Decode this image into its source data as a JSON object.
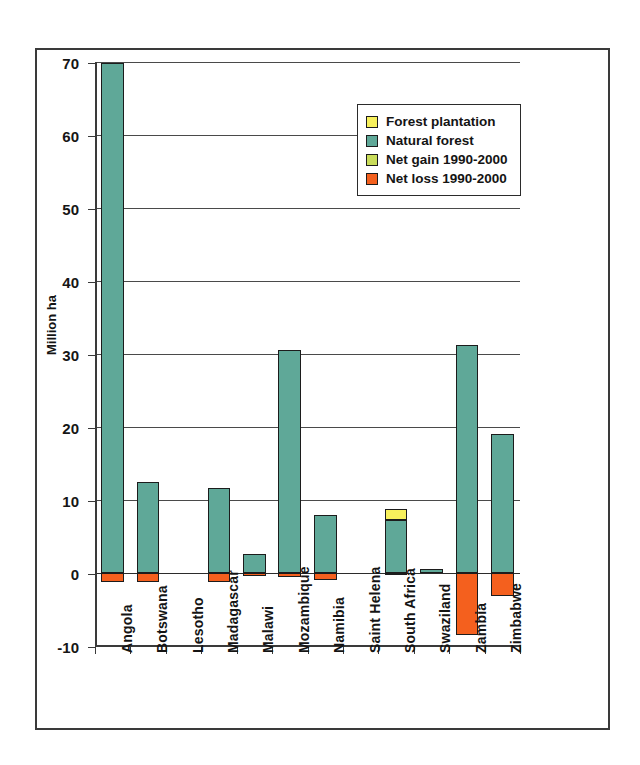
{
  "chart_data": {
    "type": "bar",
    "title": "",
    "subtitle": "",
    "xlabel": "",
    "ylabel": "Million ha",
    "ylim": [
      -10,
      70
    ],
    "ytick_values": [
      70,
      60,
      50,
      40,
      30,
      20,
      10,
      0,
      -10
    ],
    "ytick_labels": [
      "70",
      "60",
      "50",
      "40",
      "30",
      "20",
      "10",
      "0",
      "-10"
    ],
    "grid": "horizontal",
    "stacked": true,
    "legend_position": "upper-center-right",
    "categories": [
      "Angola",
      "Botswana",
      "Lesotho",
      "Madagascar",
      "Malawi",
      "Mozambique",
      "Namibia",
      "Saint Helena",
      "South Africa",
      "Swaziland",
      "Zambia",
      "Zimbabwe"
    ],
    "series": [
      {
        "name": "Forest plantation",
        "color": "#F7F05C",
        "values": [
          0,
          0,
          0,
          0,
          0,
          0,
          0,
          0,
          1.5,
          0,
          0,
          0
        ]
      },
      {
        "name": "Natural forest",
        "color": "#5FA898",
        "values": [
          69.8,
          12.4,
          0,
          11.7,
          2.6,
          30.5,
          8.0,
          0,
          7.3,
          0.5,
          31.2,
          19.0
        ]
      },
      {
        "name": "Net gain 1990-2000",
        "color": "#C9DC5A",
        "values": [
          0,
          0,
          0,
          0,
          0,
          0,
          0,
          0,
          0,
          0,
          0,
          0
        ]
      },
      {
        "name": "Net loss 1990-2000",
        "color": "#F4601E",
        "values": [
          -1.2,
          -1.3,
          0,
          -1.2,
          -0.35,
          -0.6,
          -1.0,
          0,
          -0.1,
          0,
          -8.5,
          -3.2
        ]
      }
    ]
  },
  "legend": {
    "items": [
      {
        "label": "Forest plantation",
        "color": "#F7F05C"
      },
      {
        "label": "Natural forest",
        "color": "#5FA898"
      },
      {
        "label": "Net gain 1990-2000",
        "color": "#C9DC5A"
      },
      {
        "label": "Net loss 1990-2000",
        "color": "#F4601E"
      }
    ]
  },
  "axis": {
    "y_title": "Million ha"
  }
}
